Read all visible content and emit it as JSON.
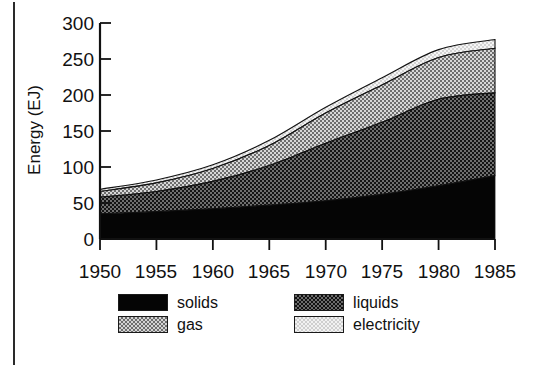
{
  "chart_data": {
    "type": "area",
    "stacked": true,
    "title": "",
    "xlabel": "",
    "ylabel": "Energy (EJ)",
    "x": [
      1950,
      1955,
      1960,
      1965,
      1970,
      1975,
      1980,
      1985
    ],
    "xlim": [
      1950,
      1985
    ],
    "ylim": [
      0,
      300
    ],
    "xticks": [
      1950,
      1955,
      1960,
      1965,
      1970,
      1975,
      1980,
      1985
    ],
    "yticks": [
      0,
      50,
      100,
      150,
      200,
      250,
      300
    ],
    "grid": false,
    "legend_position": "below",
    "series": [
      {
        "name": "solids",
        "color": "#050505",
        "pattern": "solid-black",
        "values": [
          35,
          38,
          42,
          47,
          53,
          62,
          74,
          88
        ]
      },
      {
        "name": "liquids",
        "color": "#5a5a5a",
        "pattern": "dark-dither",
        "values": [
          23,
          28,
          38,
          55,
          80,
          100,
          120,
          115
        ]
      },
      {
        "name": "gas",
        "color": "#b0b0b0",
        "pattern": "mid-dither",
        "values": [
          8,
          12,
          18,
          28,
          42,
          52,
          58,
          62
        ]
      },
      {
        "name": "electricity",
        "color": "#efefef",
        "pattern": "light-dither",
        "values": [
          3,
          4,
          5,
          7,
          8,
          10,
          11,
          12
        ]
      }
    ],
    "cumulative_totals": [
      69,
      82,
      103,
      137,
      183,
      224,
      263,
      277
    ]
  },
  "axis": {
    "y_title": "Energy (EJ)",
    "y_tick_labels": [
      "300",
      "250",
      "200",
      "150",
      "100",
      "50",
      "0"
    ],
    "x_tick_labels": [
      "1950",
      "1955",
      "1960",
      "1965",
      "1970",
      "1975",
      "1980",
      "1985"
    ]
  },
  "legend": {
    "items": [
      {
        "label": "solids",
        "swatch": "sw-solids"
      },
      {
        "label": "liquids",
        "swatch": "sw-liquids"
      },
      {
        "label": "gas",
        "swatch": "sw-gas"
      },
      {
        "label": "electricity",
        "swatch": "sw-electricity"
      }
    ]
  }
}
